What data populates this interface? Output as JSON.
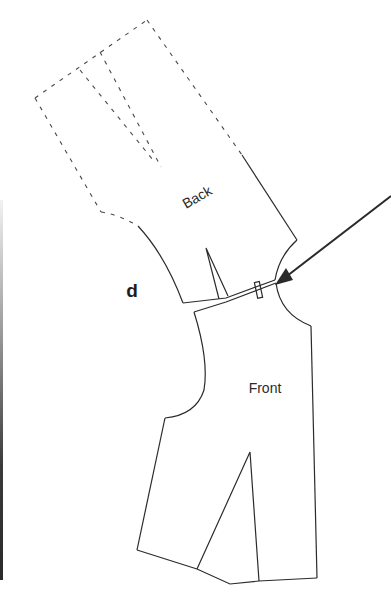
{
  "figure": {
    "label": "d",
    "pieces": [
      {
        "name": "back",
        "label": "Back"
      },
      {
        "name": "front",
        "label": "Front"
      }
    ],
    "colors": {
      "line": "#2b2b2b",
      "background": "#ffffff"
    }
  }
}
